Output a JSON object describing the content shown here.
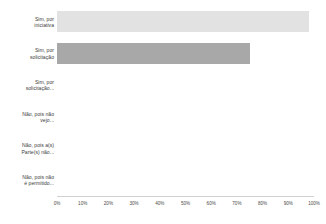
{
  "chart_data": {
    "type": "bar",
    "orientation": "horizontal",
    "title": "",
    "xlabel": "",
    "ylabel": "",
    "xlim": [
      0,
      100
    ],
    "grid": false,
    "legend": null,
    "value_suffix": "%",
    "categories": [
      "Sim, por\niniciativa",
      "Sim, por\nsolicitação",
      "Sim, por\nsolicitação...",
      "Não, pois não\nvejo...",
      "Não, pois a(s)\nParte(s) não...",
      "Não, pois não\né permitido..."
    ],
    "values": [
      98,
      75,
      0,
      0,
      0,
      0
    ],
    "bar_colors": [
      "#e2e2e2",
      "#a8a8a8",
      "#e2e2e2",
      "#e2e2e2",
      "#e2e2e2",
      "#e2e2e2"
    ],
    "xticks": [
      0,
      10,
      20,
      30,
      40,
      50,
      60,
      70,
      80,
      90,
      100
    ],
    "xticklabels": [
      "0%",
      "10%",
      "20%",
      "30%",
      "40%",
      "50%",
      "60%",
      "70%",
      "80%",
      "90%",
      "100%"
    ]
  },
  "colors": {
    "axis": "#d0d0d0",
    "text": "#3c3c3c",
    "background": "#ffffff"
  }
}
